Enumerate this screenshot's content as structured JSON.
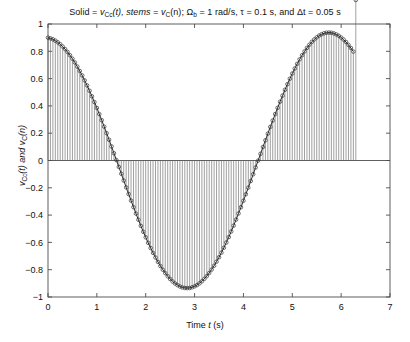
{
  "chart_data": {
    "type": "line",
    "title": "Solid = vCc(t), stems = vC(n); Ωb = 1 rad/s, τ = 0.1 s, and Δt = 0.05 s",
    "title_parts": {
      "solid_label": "Solid = ",
      "solid_var": "v",
      "solid_sub": "Cc",
      "solid_arg": "(t), stems = ",
      "stem_var": "v",
      "stem_sub": "C",
      "stem_arg": "(n); ",
      "omega": "Ω",
      "omega_sub": "b",
      "omega_val": " = 1 rad/s, τ = 0.1 s, and Δt = 0.05 s"
    },
    "xlabel": "Time t (s)",
    "xlabel_parts": {
      "pre": "Time ",
      "var": "t",
      "post": " (s)"
    },
    "ylabel": "vCc(t) and vC(n)",
    "ylabel_parts": {
      "v1": "v",
      "v1sub": "Cc",
      "v1arg": "(t) and ",
      "v2": "v",
      "v2sub": "C",
      "v2arg": "(n)"
    },
    "xlim": [
      0,
      7
    ],
    "ylim": [
      -1,
      1
    ],
    "xticks": [
      0,
      1,
      2,
      3,
      4,
      5,
      6,
      7
    ],
    "xticklabels": [
      "0",
      "1",
      "2",
      "3",
      "4",
      "5",
      "6",
      "7"
    ],
    "yticks": [
      -1,
      -0.8,
      -0.6,
      -0.4,
      -0.2,
      0,
      0.2,
      0.4,
      0.6,
      0.8,
      1
    ],
    "yticklabels": [
      "−1",
      "−0.8",
      "−0.6",
      "−0.4",
      "−0.2",
      "0",
      "0.2",
      "0.4",
      "0.6",
      "0.8",
      "1"
    ],
    "grid": false,
    "legend": "none",
    "sample_interval": 0.05,
    "sample_start": 0.0,
    "sample_end": 6.3,
    "series": [
      {
        "name": "vCc(t)",
        "style": "solid-line",
        "color": "#2b2b2b",
        "description": "continuous damped-driven capacitor voltage, cosine-like, amplitude ~1"
      },
      {
        "name": "vC(n)",
        "style": "stem-with-circle-markers",
        "color": "#555555",
        "marker": "o",
        "description": "sampled values plotted as vertical stems from zero baseline with open circle tips"
      }
    ],
    "x": [
      0.0,
      0.05,
      0.1,
      0.15,
      0.2,
      0.25,
      0.3,
      0.35,
      0.4,
      0.45,
      0.5,
      0.55,
      0.6,
      0.65,
      0.7,
      0.75,
      0.8,
      0.85,
      0.9,
      0.95,
      1.0,
      1.05,
      1.1,
      1.15,
      1.2,
      1.25,
      1.3,
      1.35,
      1.4,
      1.45,
      1.5,
      1.55,
      1.6,
      1.65,
      1.7,
      1.75,
      1.8,
      1.85,
      1.9,
      1.95,
      2.0,
      2.05,
      2.1,
      2.15,
      2.2,
      2.25,
      2.3,
      2.35,
      2.4,
      2.45,
      2.5,
      2.55,
      2.6,
      2.65,
      2.7,
      2.75,
      2.8,
      2.85,
      2.9,
      2.95,
      3.0,
      3.05,
      3.1,
      3.15,
      3.2,
      3.25,
      3.3,
      3.35,
      3.4,
      3.45,
      3.5,
      3.55,
      3.6,
      3.65,
      3.7,
      3.75,
      3.8,
      3.85,
      3.9,
      3.95,
      4.0,
      4.05,
      4.1,
      4.15,
      4.2,
      4.25,
      4.3,
      4.35,
      4.4,
      4.45,
      4.5,
      4.55,
      4.6,
      4.65,
      4.7,
      4.75,
      4.8,
      4.85,
      4.9,
      4.95,
      5.0,
      5.05,
      5.1,
      5.15,
      5.2,
      5.25,
      5.3,
      5.35,
      5.4,
      5.45,
      5.5,
      5.55,
      5.6,
      5.65,
      5.7,
      5.75,
      5.8,
      5.85,
      5.9,
      5.95,
      6.0,
      6.05,
      6.1,
      6.15,
      6.2,
      6.25,
      6.3
    ],
    "y": [
      0.9,
      0.895,
      0.888,
      0.878,
      0.866,
      0.852,
      0.835,
      0.816,
      0.795,
      0.771,
      0.746,
      0.718,
      0.688,
      0.656,
      0.623,
      0.587,
      0.55,
      0.511,
      0.47,
      0.428,
      0.385,
      0.34,
      0.295,
      0.248,
      0.2,
      0.152,
      0.103,
      0.053,
      0.003,
      -0.047,
      -0.097,
      -0.147,
      -0.197,
      -0.246,
      -0.294,
      -0.342,
      -0.389,
      -0.434,
      -0.479,
      -0.522,
      -0.563,
      -0.603,
      -0.641,
      -0.677,
      -0.711,
      -0.743,
      -0.773,
      -0.8,
      -0.825,
      -0.848,
      -0.868,
      -0.886,
      -0.901,
      -0.913,
      -0.923,
      -0.93,
      -0.934,
      -0.935,
      -0.934,
      -0.929,
      -0.922,
      -0.913,
      -0.9,
      -0.885,
      -0.867,
      -0.847,
      -0.824,
      -0.799,
      -0.771,
      -0.741,
      -0.709,
      -0.675,
      -0.639,
      -0.601,
      -0.561,
      -0.52,
      -0.477,
      -0.433,
      -0.388,
      -0.342,
      -0.295,
      -0.247,
      -0.199,
      -0.15,
      -0.101,
      -0.051,
      -0.001,
      0.049,
      0.099,
      0.148,
      0.197,
      0.246,
      0.293,
      0.34,
      0.386,
      0.431,
      0.475,
      0.518,
      0.559,
      0.599,
      0.637,
      0.674,
      0.708,
      0.741,
      0.771,
      0.799,
      0.825,
      0.848,
      0.869,
      0.887,
      0.902,
      0.915,
      0.925,
      0.932,
      0.936,
      0.937,
      0.936,
      0.931,
      0.924,
      0.914,
      0.901,
      0.886,
      0.868,
      0.847,
      0.824,
      0.798
    ]
  },
  "axes": {
    "frame_color": "#4d4d4d",
    "tick_label_size": 9
  }
}
